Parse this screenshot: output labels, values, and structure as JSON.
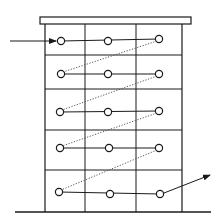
{
  "diagram": {
    "type": "building-flow-schematic",
    "colors": {
      "line": "#1a1a1a",
      "dotted": "#555555",
      "background": "#ffffff"
    },
    "floors": 5,
    "columns": 3,
    "nodes": [
      {
        "row": 1,
        "col": 1,
        "x": 61,
        "y": 41
      },
      {
        "row": 1,
        "col": 2,
        "x": 108,
        "y": 41
      },
      {
        "row": 1,
        "col": 3,
        "x": 159,
        "y": 39
      },
      {
        "row": 2,
        "col": 1,
        "x": 61,
        "y": 74
      },
      {
        "row": 2,
        "col": 2,
        "x": 108,
        "y": 74
      },
      {
        "row": 2,
        "col": 3,
        "x": 159,
        "y": 74
      },
      {
        "row": 3,
        "col": 1,
        "x": 60,
        "y": 112
      },
      {
        "row": 3,
        "col": 2,
        "x": 108,
        "y": 112
      },
      {
        "row": 3,
        "col": 3,
        "x": 159,
        "y": 111
      },
      {
        "row": 4,
        "col": 1,
        "x": 60,
        "y": 148
      },
      {
        "row": 4,
        "col": 2,
        "x": 109,
        "y": 148
      },
      {
        "row": 4,
        "col": 3,
        "x": 159,
        "y": 148
      },
      {
        "row": 5,
        "col": 1,
        "x": 59,
        "y": 192
      },
      {
        "row": 5,
        "col": 2,
        "x": 110,
        "y": 194
      },
      {
        "row": 5,
        "col": 3,
        "x": 160,
        "y": 194
      }
    ],
    "inlet_arrow": {
      "from": [
        10,
        41
      ],
      "to": [
        56,
        41
      ]
    },
    "outlet_arrow": {
      "from": [
        164,
        193
      ],
      "to": [
        210,
        175
      ]
    }
  }
}
